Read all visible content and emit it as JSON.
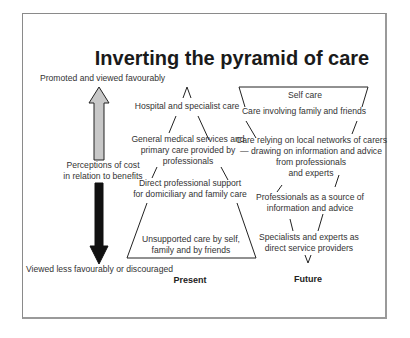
{
  "title": "Inverting the pyramid of care",
  "axis": {
    "top_label": "Promoted and viewed favourably",
    "middle_label_line1": "Perceptions of cost",
    "middle_label_line2": "in relation to benefits",
    "bottom_label": "Viewed less favourably or discouraged",
    "up_arrow_color": "#c8c8c8",
    "down_arrow_color": "#111111"
  },
  "present": {
    "caption": "Present",
    "levels": [
      {
        "lines": [
          "Hospital and specialist care"
        ]
      },
      {
        "lines": [
          "General medical services and",
          "primary care provided by",
          "professionals"
        ]
      },
      {
        "lines": [
          "Direct professional support",
          "for domiciliary and family care"
        ]
      },
      {
        "lines": [
          "Unsupported care by self,",
          "family and by friends"
        ]
      }
    ]
  },
  "future": {
    "caption": "Future",
    "levels": [
      {
        "lines": [
          "Self care"
        ]
      },
      {
        "lines": [
          "Care involving family and friends"
        ]
      },
      {
        "lines": [
          "Care relying on local networks of carers",
          "— drawing on information and advice",
          "from professionals",
          "and experts"
        ]
      },
      {
        "lines": [
          "Professionals as a source of",
          "information and advice"
        ]
      },
      {
        "lines": [
          "Specialists and experts as",
          "direct service providers"
        ]
      }
    ]
  }
}
